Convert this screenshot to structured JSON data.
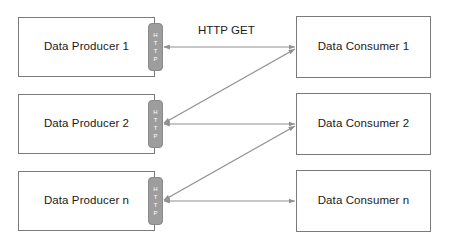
{
  "diagram": {
    "colors": {
      "box_border": "#7a7a7a",
      "connector_fill": "#9d9d9d",
      "connector_text": "#ffffff",
      "arrow": "#8f8f8f",
      "text": "#1a1a1a",
      "background": "#ffffff"
    },
    "producers": [
      {
        "label": "Data Producer 1",
        "connector": "HTTP"
      },
      {
        "label": "Data Producer 2",
        "connector": "HTTP"
      },
      {
        "label": "Data Producer n",
        "connector": "HTTP"
      }
    ],
    "consumers": [
      {
        "label": "Data Consumer 1"
      },
      {
        "label": "Data Consumer 2"
      },
      {
        "label": "Data Consumer n"
      }
    ],
    "connector_letters": [
      "H",
      "T",
      "T",
      "P"
    ],
    "edge_labels": {
      "http_get": "HTTP GET"
    },
    "connections": [
      {
        "from": "Data Producer 1",
        "to": "Data Consumer 1",
        "protocol": "HTTP GET",
        "style": "horizontal",
        "bidirectional": true
      },
      {
        "from": "Data Producer 2",
        "to": "Data Consumer 2",
        "protocol": "HTTP GET",
        "style": "horizontal",
        "bidirectional": true
      },
      {
        "from": "Data Producer n",
        "to": "Data Consumer n",
        "protocol": "HTTP GET",
        "style": "horizontal",
        "bidirectional": true
      },
      {
        "from": "Data Producer 2",
        "to": "Data Consumer 1",
        "protocol": "HTTP GET",
        "style": "diagonal",
        "bidirectional": true
      },
      {
        "from": "Data Producer n",
        "to": "Data Consumer 2",
        "protocol": "HTTP GET",
        "style": "diagonal",
        "bidirectional": true
      }
    ]
  }
}
